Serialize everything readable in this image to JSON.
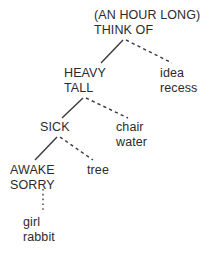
{
  "diagram": {
    "type": "tree",
    "background_color": "#ffffff",
    "text_color": "#2b2b2b",
    "edge_color": "#3a3a3a",
    "nodes": [
      {
        "id": "root",
        "line1": "(AN HOUR LONG)",
        "line2": "THINK OF",
        "case": "upper"
      },
      {
        "id": "heavy",
        "line1": "HEAVY",
        "line2": "TALL",
        "case": "upper"
      },
      {
        "id": "idea",
        "line1": "idea",
        "line2": "recess",
        "case": "lower"
      },
      {
        "id": "sick",
        "line1": "SICK",
        "line2": "",
        "case": "upper"
      },
      {
        "id": "chair",
        "line1": "chair",
        "line2": "water",
        "case": "lower"
      },
      {
        "id": "awake",
        "line1": "AWAKE",
        "line2": "SORRY",
        "case": "upper"
      },
      {
        "id": "tree",
        "line1": "tree",
        "line2": "",
        "case": "lower"
      },
      {
        "id": "girl",
        "line1": "girl",
        "line2": "rabbit",
        "case": "lower"
      }
    ],
    "edges": [
      {
        "id": "root-to-heavy",
        "from": "root",
        "to": "heavy",
        "style": "solid",
        "x1": 123,
        "y1": 40,
        "x2": 101,
        "y2": 63
      },
      {
        "id": "root-to-idea",
        "from": "root",
        "to": "idea",
        "style": "dashed",
        "x1": 126,
        "y1": 40,
        "x2": 172,
        "y2": 63
      },
      {
        "id": "tall-to-sick",
        "from": "heavy",
        "to": "sick",
        "style": "solid",
        "x1": 83,
        "y1": 98,
        "x2": 62,
        "y2": 118
      },
      {
        "id": "tall-to-chair",
        "from": "heavy",
        "to": "chair",
        "style": "dashed",
        "x1": 86,
        "y1": 98,
        "x2": 128,
        "y2": 118
      },
      {
        "id": "sick-to-awake",
        "from": "sick",
        "to": "awake",
        "style": "solid",
        "x1": 57,
        "y1": 137,
        "x2": 35,
        "y2": 160
      },
      {
        "id": "sick-to-tree",
        "from": "sick",
        "to": "tree",
        "style": "dashed",
        "x1": 60,
        "y1": 137,
        "x2": 93,
        "y2": 160
      },
      {
        "id": "sorry-to-girl",
        "from": "awake",
        "to": "girl",
        "style": "dotted",
        "x1": 43,
        "y1": 189,
        "x2": 43,
        "y2": 212
      }
    ]
  }
}
